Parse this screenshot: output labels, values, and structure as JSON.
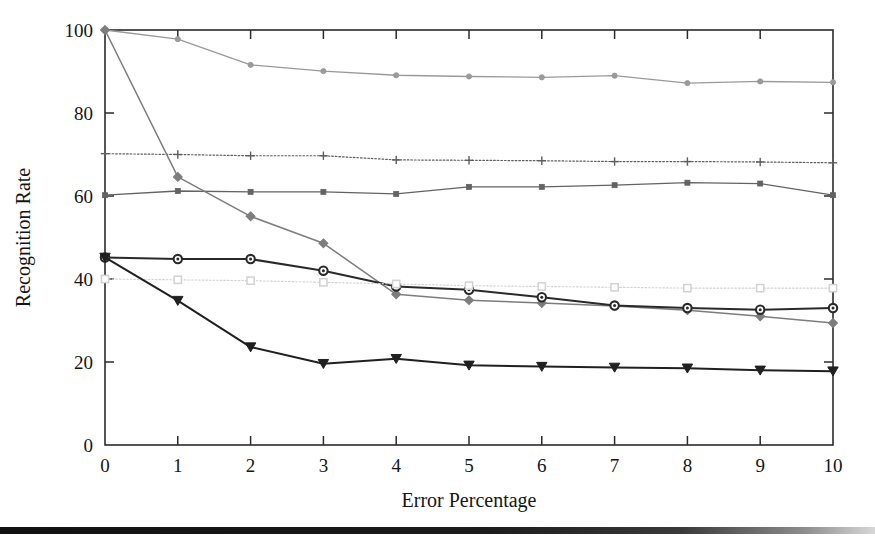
{
  "figure": {
    "background_color": "#ffffff",
    "scan_bar": {
      "name": "page-scan-edge",
      "top": 527,
      "height": 7,
      "color": "#141414"
    }
  },
  "chart_data": {
    "type": "line",
    "title": "",
    "subtitle": "",
    "xlabel": "Error Percentage",
    "ylabel": "Recognition Rate",
    "xlim": [
      0,
      10
    ],
    "ylim": [
      0,
      100
    ],
    "xticks": [
      0,
      1,
      2,
      3,
      4,
      5,
      6,
      7,
      8,
      9,
      10
    ],
    "xtick_labels": [
      "0",
      "1",
      "2",
      "3",
      "4",
      "5",
      "6",
      "7",
      "8",
      "9",
      "10"
    ],
    "yticks": [
      0,
      20,
      40,
      60,
      80,
      100
    ],
    "ytick_labels": [
      "0",
      "20",
      "40",
      "60",
      "80",
      "100"
    ],
    "grid": false,
    "legend_position": "none",
    "x": [
      0,
      1,
      2,
      3,
      4,
      5,
      6,
      7,
      8,
      9,
      10
    ],
    "series": [
      {
        "name": "series-1",
        "marker": "circle-small",
        "color": "#9a9a9a",
        "linestyle": "solid",
        "linewidth": 1.3,
        "values": [
          100,
          97.8,
          91.6,
          90.1,
          89.1,
          88.8,
          88.6,
          89.0,
          87.2,
          87.6,
          87.4
        ]
      },
      {
        "name": "series-2",
        "marker": "plus",
        "color": "#5e5e5e",
        "linestyle": "dotted",
        "linewidth": 1.2,
        "values": [
          70.2,
          70.0,
          69.7,
          69.7,
          68.7,
          68.6,
          68.5,
          68.3,
          68.3,
          68.2,
          68.0
        ]
      },
      {
        "name": "series-3",
        "marker": "square-small",
        "color": "#636363",
        "linestyle": "solid",
        "linewidth": 1.3,
        "values": [
          60.2,
          61.2,
          61.0,
          61.0,
          60.5,
          62.2,
          62.2,
          62.6,
          63.2,
          63.0,
          60.2
        ]
      },
      {
        "name": "series-4",
        "marker": "diamond",
        "color": "#7d7d7d",
        "linestyle": "solid",
        "linewidth": 1.5,
        "values": [
          100,
          64.6,
          55.1,
          48.6,
          36.3,
          34.9,
          34.2,
          33.5,
          32.5,
          31.0,
          29.4
        ]
      },
      {
        "name": "series-5",
        "marker": "circle-open",
        "color": "#2a2a2a",
        "linestyle": "solid",
        "linewidth": 2.0,
        "values": [
          45.2,
          44.8,
          44.8,
          42.0,
          38.2,
          37.4,
          35.6,
          33.6,
          33.0,
          32.6,
          33.0
        ]
      },
      {
        "name": "series-6",
        "marker": "square-open",
        "color": "#d2d2d2",
        "linestyle": "dotted",
        "linewidth": 1.1,
        "values": [
          40.0,
          39.8,
          39.6,
          39.2,
          38.8,
          38.4,
          38.2,
          38.0,
          37.8,
          37.8,
          37.8
        ]
      },
      {
        "name": "series-7",
        "marker": "triangle-down",
        "color": "#202020",
        "linestyle": "solid",
        "linewidth": 2.0,
        "values": [
          45.2,
          34.8,
          23.6,
          19.6,
          20.8,
          19.2,
          18.9,
          18.7,
          18.5,
          18.0,
          17.8
        ]
      }
    ]
  }
}
